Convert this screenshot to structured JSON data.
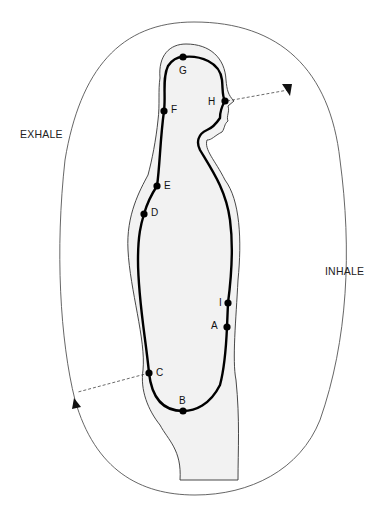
{
  "diagram": {
    "labels": {
      "exhale": "EXHALE",
      "inhale": "INHALE"
    },
    "points": [
      {
        "id": "A",
        "label": "A",
        "x": 227,
        "y": 327,
        "lx": 211,
        "ly": 321
      },
      {
        "id": "B",
        "label": "B",
        "x": 183,
        "y": 411,
        "lx": 179,
        "ly": 396
      },
      {
        "id": "C",
        "label": "C",
        "x": 149,
        "y": 373,
        "lx": 156,
        "ly": 368
      },
      {
        "id": "D",
        "label": "D",
        "x": 144,
        "y": 214,
        "lx": 151,
        "ly": 208
      },
      {
        "id": "E",
        "label": "E",
        "x": 157,
        "y": 186,
        "lx": 164,
        "ly": 181
      },
      {
        "id": "F",
        "label": "F",
        "x": 164,
        "y": 111,
        "lx": 171,
        "ly": 105
      },
      {
        "id": "G",
        "label": "G",
        "x": 183,
        "y": 57,
        "lx": 179,
        "ly": 66
      },
      {
        "id": "H",
        "label": "H",
        "x": 225,
        "y": 101,
        "lx": 208,
        "ly": 97
      },
      {
        "id": "I",
        "label": "I",
        "x": 228,
        "y": 303,
        "lx": 219,
        "ly": 298
      }
    ],
    "colors": {
      "path": "#000000",
      "outline": "#333333",
      "body_fill": "#f2f2f2",
      "loop": "#555555"
    },
    "caption": "..."
  }
}
